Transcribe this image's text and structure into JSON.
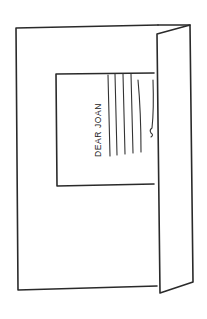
{
  "illustration": {
    "subject": "greeting card opened with letter inside",
    "letter": {
      "greeting": "DEAR JOAN",
      "text_lines": 5
    },
    "colors": {
      "ink": "#2a2a2a",
      "paper": "#ffffff"
    }
  }
}
